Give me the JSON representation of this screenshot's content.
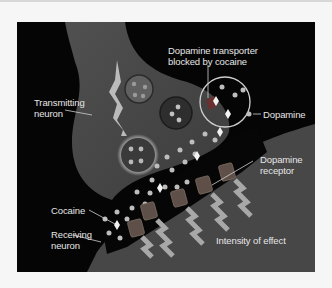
{
  "diagram": {
    "labels": {
      "transporter": [
        "Dopamine transporter",
        "blocked by cocaine"
      ],
      "transmitting": [
        "Transmitting",
        "neuron"
      ],
      "dopamine": "Dopamine",
      "receptor": [
        "Dopamine",
        "receptor"
      ],
      "cocaine": "Cocaine",
      "receiving": [
        "Receiving",
        "neuron"
      ],
      "intensity": "Intensity of effect"
    },
    "colors": {
      "background": "#050505",
      "neuron": "#4a4a4a",
      "vesicle": "#353535",
      "dopamine": "#bdbdbd",
      "text": "#e6e6e6",
      "arrow": "#a8a8a8"
    }
  }
}
